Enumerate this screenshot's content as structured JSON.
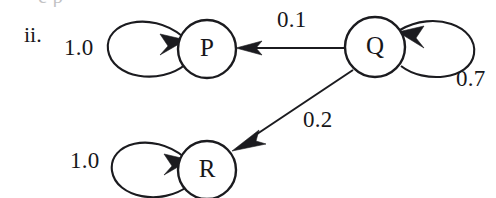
{
  "figure": {
    "item_label": "ii.",
    "caption_bleed": "e p",
    "background_color": "#ffffff",
    "ink_color": "#1b1b1f"
  },
  "graph": {
    "type": "markov-state-diagram",
    "nodes": [
      {
        "id": "P",
        "label": "P",
        "cx": 207,
        "cy": 49,
        "r": 29
      },
      {
        "id": "Q",
        "label": "Q",
        "cx": 375,
        "cy": 47,
        "r": 30
      },
      {
        "id": "R",
        "label": "R",
        "cx": 207,
        "cy": 170,
        "r": 29
      }
    ],
    "edges": [
      {
        "from": "P",
        "to": "P",
        "weight": "1.0",
        "kind": "self-loop",
        "side": "left"
      },
      {
        "from": "Q",
        "to": "P",
        "weight": "0.1",
        "kind": "straight",
        "direction": "right-to-left"
      },
      {
        "from": "Q",
        "to": "Q",
        "weight": "0.7",
        "kind": "self-loop",
        "side": "right"
      },
      {
        "from": "Q",
        "to": "R",
        "weight": "0.2",
        "kind": "diagonal",
        "direction": "upper-right-to-lower-left"
      },
      {
        "from": "R",
        "to": "R",
        "weight": "1.0",
        "kind": "self-loop",
        "side": "left"
      }
    ],
    "weight_labels": [
      {
        "id": "w-p-self",
        "text": "1.0",
        "x": 64,
        "y": 36
      },
      {
        "id": "w-q-p",
        "text": "0.1",
        "x": 277,
        "y": 8
      },
      {
        "id": "w-q-self",
        "text": "0.7",
        "x": 456,
        "y": 67
      },
      {
        "id": "w-q-r",
        "text": "0.2",
        "x": 303,
        "y": 108
      },
      {
        "id": "w-r-self",
        "text": "1.0",
        "x": 70,
        "y": 149
      }
    ]
  }
}
